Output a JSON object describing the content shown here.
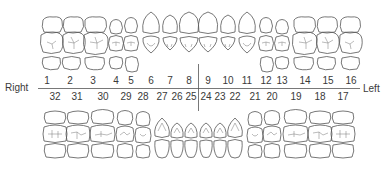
{
  "diagram": {
    "labels": {
      "right": "Right",
      "left": "Left"
    },
    "upper_arch": {
      "numbers": [
        "1",
        "2",
        "3",
        "4",
        "5",
        "6",
        "7",
        "8",
        "9",
        "10",
        "11",
        "12",
        "13",
        "14",
        "15",
        "16"
      ],
      "x": [
        47,
        70,
        93,
        116,
        131,
        151,
        170,
        189,
        208,
        228,
        247,
        266,
        282,
        305,
        328,
        351
      ]
    },
    "lower_arch": {
      "numbers": [
        "32",
        "31",
        "30",
        "29",
        "28",
        "27",
        "26",
        "25",
        "24",
        "23",
        "22",
        "21",
        "20",
        "19",
        "18",
        "17"
      ],
      "x": [
        55,
        77,
        103,
        126,
        143,
        162,
        177,
        191,
        206,
        220,
        235,
        255,
        272,
        296,
        320,
        343
      ]
    },
    "colors": {
      "line": "#555555",
      "text": "#3a3a3a",
      "background": "#ffffff"
    }
  }
}
